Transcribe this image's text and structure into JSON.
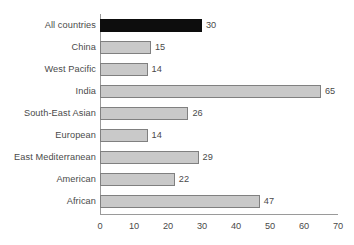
{
  "chart_data": {
    "type": "bar",
    "orientation": "horizontal",
    "title": "",
    "subtitle": "",
    "xlabel": "",
    "ylabel": "",
    "categories": [
      "All countries",
      "China",
      "West Pacific",
      "India",
      "South-East Asian",
      "European",
      "East Mediterranean",
      "American",
      "African"
    ],
    "values": [
      30,
      15,
      14,
      65,
      26,
      14,
      29,
      22,
      47
    ],
    "value_labels": [
      "30",
      "15",
      "14",
      "65",
      "26",
      "14",
      "29",
      "22",
      "47"
    ],
    "highlight_index": 0,
    "xlim": [
      0,
      70
    ],
    "xticks": [
      0,
      10,
      20,
      30,
      40,
      50,
      60,
      70
    ],
    "xtick_labels": [
      "0",
      "10",
      "20",
      "30",
      "40",
      "50",
      "60",
      "70"
    ],
    "grid": false,
    "legend": null,
    "colors": {
      "bar_fill": "#c9c9c9",
      "bar_border": "#808080",
      "highlight_fill": "#0d0d0d",
      "axis": "#9a9a9a",
      "text": "#4a4a4a",
      "background": "#ffffff"
    }
  }
}
